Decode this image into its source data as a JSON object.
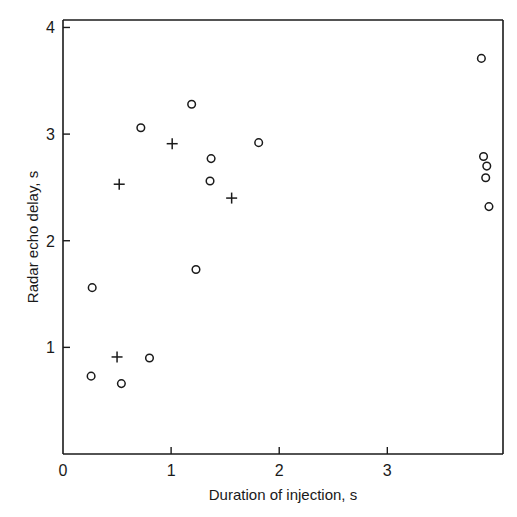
{
  "chart_data": {
    "type": "scatter",
    "title": "",
    "xlabel": "Duration of injection, s",
    "ylabel": "Radar echo delay, s",
    "xlim": [
      0,
      4.07
    ],
    "ylim": [
      0,
      4.07
    ],
    "x_ticks": [
      {
        "value": 0,
        "label": "0"
      },
      {
        "value": 1,
        "label": "1"
      },
      {
        "value": 2,
        "label": "2"
      },
      {
        "value": 3,
        "label": "3"
      }
    ],
    "y_ticks": [
      {
        "value": 1,
        "label": "1"
      },
      {
        "value": 2,
        "label": "2"
      },
      {
        "value": 3,
        "label": "3"
      },
      {
        "value": 4,
        "label": "4"
      }
    ],
    "grid": false,
    "legend": null,
    "series": [
      {
        "name": "circles",
        "marker": "circle",
        "points": [
          {
            "x": 0.26,
            "y": 0.73
          },
          {
            "x": 0.27,
            "y": 1.56
          },
          {
            "x": 0.54,
            "y": 0.66
          },
          {
            "x": 0.8,
            "y": 0.9
          },
          {
            "x": 0.72,
            "y": 3.06
          },
          {
            "x": 1.19,
            "y": 3.28
          },
          {
            "x": 1.23,
            "y": 1.73
          },
          {
            "x": 1.37,
            "y": 2.77
          },
          {
            "x": 1.36,
            "y": 2.56
          },
          {
            "x": 1.81,
            "y": 2.92
          },
          {
            "x": 3.87,
            "y": 3.71
          },
          {
            "x": 3.89,
            "y": 2.79
          },
          {
            "x": 3.92,
            "y": 2.7
          },
          {
            "x": 3.91,
            "y": 2.59
          },
          {
            "x": 3.94,
            "y": 2.32
          }
        ]
      },
      {
        "name": "crosses",
        "marker": "plus",
        "points": [
          {
            "x": 0.5,
            "y": 0.91
          },
          {
            "x": 0.52,
            "y": 2.53
          },
          {
            "x": 1.01,
            "y": 2.91
          },
          {
            "x": 1.56,
            "y": 2.4
          }
        ]
      }
    ]
  }
}
